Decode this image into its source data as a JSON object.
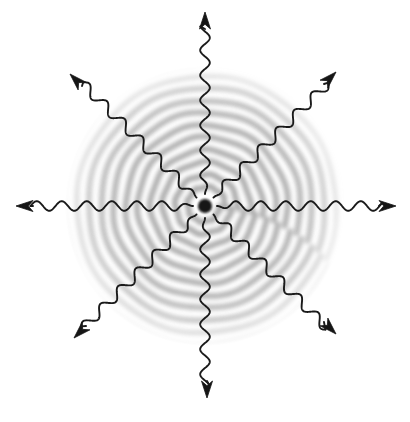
{
  "figure": {
    "background_color": "#ffffff",
    "ink_color": "#1a1a1a",
    "wave_band_color": "#6e6e6e",
    "canvas": {
      "width": 410,
      "height": 422
    }
  },
  "source": {
    "label": "point-source",
    "center_x": 205,
    "center_y": 206,
    "core_radius": 7,
    "core_color": "#121212"
  },
  "wavefield": {
    "label": "concentric-wavefronts",
    "type": "spiral-rings",
    "inner_radius": 10,
    "outer_radius": 140,
    "fade_start_radius": 96,
    "ring_period": 12.6,
    "ring_count": 11,
    "spiral_twist_deg": 26,
    "max_darkness": 0.62,
    "blur_px": 2.2
  },
  "chart_data": {
    "type": "scatter",
    "xlabel": "",
    "ylabel": "",
    "xlim": [
      0,
      410
    ],
    "ylim": [
      0,
      422
    ],
    "grid": false,
    "legend": "none",
    "center": [
      205,
      206
    ],
    "ring_radii": [
      14,
      26,
      39,
      51,
      64,
      76,
      89,
      101,
      114,
      126,
      138
    ],
    "ray_count": 8,
    "ray_angles_deg": [
      0,
      45,
      90,
      135,
      180,
      225,
      270,
      315
    ],
    "wave_wavelength_px": 25,
    "wave_amplitude_px": 4.6,
    "arrow_tip_radius_px": 192,
    "wave_start_radius_px": 12
  },
  "rays": [
    {
      "name": "ray-right",
      "angle_deg": 0,
      "direction": "east",
      "tip_x": 396,
      "tip_y": 206,
      "start_radius": 12,
      "tip_radius": 191,
      "wavelength": 25,
      "amplitude": 4.8
    },
    {
      "name": "ray-up-right",
      "angle_deg": 315,
      "direction": "northeast",
      "tip_x": 336,
      "tip_y": 72,
      "start_radius": 12,
      "tip_radius": 189,
      "wavelength": 25,
      "amplitude": 4.8
    },
    {
      "name": "ray-up",
      "angle_deg": 270,
      "direction": "north",
      "tip_x": 205,
      "tip_y": 12,
      "start_radius": 12,
      "tip_radius": 194,
      "wavelength": 25,
      "amplitude": 4.8
    },
    {
      "name": "ray-up-left",
      "angle_deg": 225,
      "direction": "northwest",
      "tip_x": 70,
      "tip_y": 74,
      "start_radius": 12,
      "tip_radius": 188,
      "wavelength": 25,
      "amplitude": 4.8
    },
    {
      "name": "ray-left",
      "angle_deg": 180,
      "direction": "west",
      "tip_x": 16,
      "tip_y": 206,
      "start_radius": 12,
      "tip_radius": 189,
      "wavelength": 25,
      "amplitude": 4.8
    },
    {
      "name": "ray-down-left",
      "angle_deg": 135,
      "direction": "southwest",
      "tip_x": 74,
      "tip_y": 338,
      "start_radius": 12,
      "tip_radius": 187,
      "wavelength": 25,
      "amplitude": 4.8
    },
    {
      "name": "ray-down",
      "angle_deg": 90,
      "direction": "south",
      "tip_x": 207,
      "tip_y": 398,
      "start_radius": 12,
      "tip_radius": 192,
      "wavelength": 25,
      "amplitude": 4.8
    },
    {
      "name": "ray-down-right",
      "angle_deg": 45,
      "direction": "southeast",
      "tip_x": 336,
      "tip_y": 334,
      "start_radius": 12,
      "tip_radius": 187,
      "wavelength": 25,
      "amplitude": 4.8
    }
  ],
  "arrowhead": {
    "name": "arrowhead",
    "shape": "solid-triangle",
    "length": 17,
    "half_width": 5.5,
    "color": "#151515"
  }
}
